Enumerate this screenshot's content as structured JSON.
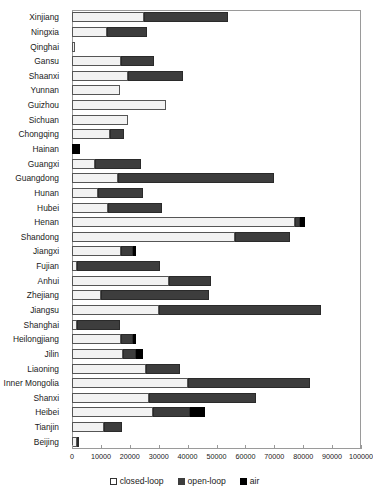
{
  "chart_data": {
    "type": "bar",
    "orientation": "horizontal",
    "stacked": true,
    "title": "",
    "xlabel": "",
    "ylabel": "",
    "xlim": [
      0,
      100000
    ],
    "xticks": [
      0,
      10000,
      20000,
      30000,
      40000,
      50000,
      60000,
      70000,
      80000,
      90000,
      100000
    ],
    "xtick_labels": [
      "0",
      "10000",
      "20000",
      "30000",
      "40000",
      "50000",
      "60000",
      "70000",
      "80000",
      "90000",
      "100000"
    ],
    "grid": false,
    "legend_position": "bottom-center",
    "legend": [
      "closed-loop",
      "open-loop",
      "air"
    ],
    "series": [
      {
        "name": "closed-loop",
        "color": "#f2f2f2",
        "values": [
          25000,
          12000,
          1200,
          17000,
          19500,
          16500,
          32500,
          19500,
          13000,
          0,
          8000,
          16000,
          9000,
          12500,
          77000,
          56500,
          17000,
          1800,
          33500,
          10000,
          30000,
          1800,
          17000,
          17500,
          25500,
          40000,
          26500,
          28000,
          11000,
          1800
        ]
      },
      {
        "name": "open-loop",
        "color": "#3d3d3d",
        "values": [
          29000,
          14000,
          0,
          11500,
          19000,
          0,
          0,
          0,
          5000,
          0,
          16000,
          54000,
          15500,
          18500,
          2000,
          19000,
          4000,
          28700,
          14500,
          37500,
          56000,
          14700,
          4000,
          4500,
          12000,
          42500,
          37000,
          13000,
          6200,
          700
        ]
      },
      {
        "name": "air",
        "color": "#000000",
        "values": [
          0,
          0,
          0,
          0,
          0,
          0,
          0,
          0,
          0,
          2800,
          0,
          0,
          0,
          0,
          1500,
          0,
          1000,
          0,
          0,
          0,
          0,
          0,
          1200,
          2500,
          0,
          0,
          0,
          5000,
          0,
          0
        ]
      }
    ],
    "categories": [
      "Xinjiang",
      "Ningxia",
      "Qinghai",
      "Gansu",
      "Shaanxi",
      "Yunnan",
      "Guizhou",
      "Sichuan",
      "Chongqing",
      "Hainan",
      "Guangxi",
      "Guangdong",
      "Hunan",
      "Hubei",
      "Henan",
      "Shandong",
      "Jiangxi",
      "Fujian",
      "Anhui",
      "Zhejiang",
      "Jiangsu",
      "Shanghai",
      "Heilongjiang",
      "Jilin",
      "Liaoning",
      "Inner Mongolia",
      "Shanxi",
      "Heibei",
      "Tianjin",
      "Beijing"
    ]
  },
  "legend": {
    "items": [
      {
        "label": "closed-loop",
        "key": "closed"
      },
      {
        "label": "open-loop",
        "key": "open"
      },
      {
        "label": "air",
        "key": "air"
      }
    ]
  }
}
